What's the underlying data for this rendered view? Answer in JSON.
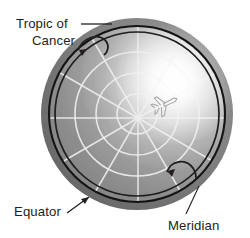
{
  "figure": {
    "type": "polar-globe-diagram",
    "background_color": "#ffffff",
    "globe": {
      "center": [
        137,
        114
      ],
      "radius": 96,
      "rim_outer_color": "#6f6f6f",
      "rim_inner_color": "#8a8a8a",
      "surface_base_color": "#8c8c8c",
      "highlight_color": "#ffffff",
      "highlight_center": [
        176,
        84
      ],
      "pole_center": [
        138,
        118
      ],
      "graticule_color": "#e8e8e8",
      "meridian_count": 12,
      "latitude_circle_radii": [
        20,
        41,
        62,
        82
      ],
      "equator_line_radius": 88,
      "equator_line_color": "#1a1a1a",
      "tropic_of_cancer_radius": 82,
      "tropic_line_color": "#1a1a1a"
    },
    "airplane": {
      "name": "airplane-icon",
      "position": [
        164,
        105
      ],
      "stroke_color": "#9a9a9a"
    }
  },
  "labels": {
    "tropic_of_cancer": {
      "line1": "Tropic of",
      "line2": "Cancer",
      "x": 16,
      "y1": 28,
      "y2": 45,
      "color": "#231f20"
    },
    "equator": {
      "text": "Equator",
      "x": 14,
      "y": 216,
      "color": "#231f20"
    },
    "meridian": {
      "text": "Meridian",
      "x": 168,
      "y": 230,
      "color": "#231f20"
    }
  },
  "annotations": {
    "tropic_leader_label": "tropic-leader-line",
    "tropic_arrow_label": "tropic-curved-arrow",
    "equator_arrow_label": "equator-arrow",
    "meridian_leader_label": "meridian-leader-line",
    "meridian_arrow_label": "meridian-curved-arrow"
  }
}
